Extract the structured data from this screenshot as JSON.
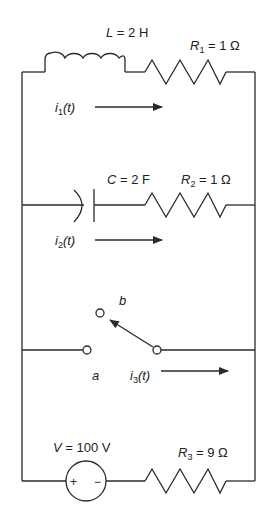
{
  "diagram": {
    "type": "circuit",
    "colors": {
      "ink": "#2a2a2a",
      "background": "#ffffff"
    },
    "branches": [
      {
        "id": "branch-1",
        "components": [
          {
            "kind": "inductor",
            "symbol": "L",
            "value": "2 H",
            "label": "L = 2 H"
          },
          {
            "kind": "resistor",
            "symbol": "R",
            "subscript": "1",
            "value": "1 Ω",
            "label": "R1 = 1 Ω"
          }
        ],
        "current": {
          "symbol": "i",
          "subscript": "1",
          "arg": "(t)",
          "label": "i1(t)",
          "direction": "right"
        }
      },
      {
        "id": "branch-2",
        "components": [
          {
            "kind": "capacitor",
            "symbol": "C",
            "value": "2 F",
            "label": "C = 2 F"
          },
          {
            "kind": "resistor",
            "symbol": "R",
            "subscript": "2",
            "value": "1 Ω",
            "label": "R2 = 1 Ω"
          }
        ],
        "current": {
          "symbol": "i",
          "subscript": "2",
          "arg": "(t)",
          "label": "i2(t)",
          "direction": "right"
        }
      },
      {
        "id": "branch-3",
        "components": [
          {
            "kind": "switch",
            "terminals": [
              "a",
              "b"
            ],
            "position": "b"
          }
        ],
        "current": {
          "symbol": "i",
          "subscript": "3",
          "arg": "(t)",
          "label": "i3(t)",
          "direction": "right"
        }
      },
      {
        "id": "branch-4",
        "components": [
          {
            "kind": "voltage-source",
            "symbol": "V",
            "value": "100 V",
            "label": "V = 100 V",
            "plus": "+",
            "minus": "−"
          },
          {
            "kind": "resistor",
            "symbol": "R",
            "subscript": "3",
            "value": "9 Ω",
            "label": "R3 = 9 Ω"
          }
        ]
      }
    ],
    "text": {
      "L_sym": "L",
      "L_eq": " = 2 H",
      "R1_sym": "R",
      "R1_sub": "1",
      "R1_eq": " = 1 Ω",
      "i1_sym": "i",
      "i1_sub": "1",
      "i1_arg": "(t)",
      "C_sym": "C",
      "C_eq": " = 2 F",
      "R2_sym": "R",
      "R2_sub": "2",
      "R2_eq": " = 1 Ω",
      "i2_sym": "i",
      "i2_sub": "2",
      "i2_arg": "(t)",
      "b": "b",
      "a": "a",
      "i3_sym": "i",
      "i3_sub": "3",
      "i3_arg": "(t)",
      "V_sym": "V",
      "V_eq": " = 100 V",
      "plus": "+",
      "minus": "−",
      "R3_sym": "R",
      "R3_sub": "3",
      "R3_eq": " = 9 Ω"
    }
  }
}
